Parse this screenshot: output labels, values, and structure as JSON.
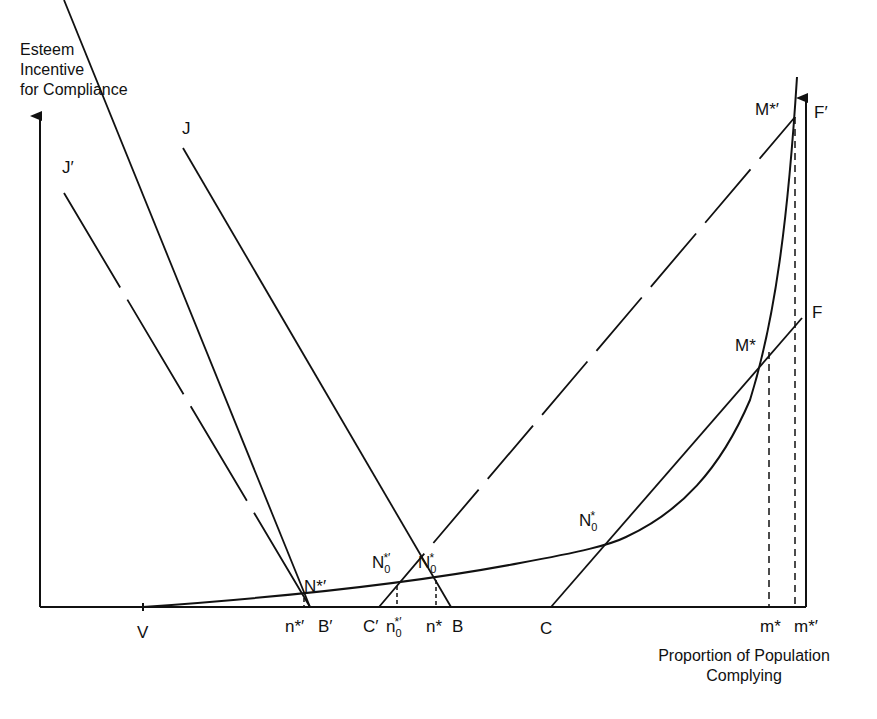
{
  "figure": {
    "y_axis_label": [
      "Esteem",
      "Incentive",
      "for Compliance"
    ],
    "x_axis_label": [
      "Proportion of Population",
      "Complying"
    ]
  },
  "curve_labels": {
    "J": "J",
    "J_prime": "J′",
    "F": "F",
    "F_prime": "F′"
  },
  "point_labels": {
    "M_star": "M*",
    "M_star_prime": "M*′",
    "N0_star": {
      "base": "N",
      "sup": "*",
      "sub": "0"
    },
    "N0_star_prime": {
      "base": "N",
      "sup": "*′",
      "sub": "0"
    },
    "N_star_prime": "N*′"
  },
  "axis_tick_labels": {
    "V": "V",
    "n_star_prime": "n*′",
    "B_prime": "B′",
    "C_prime": "C′",
    "n0_star_prime": {
      "base": "n",
      "sup": "*′",
      "sub": "0"
    },
    "n_star": "n*",
    "B": "B",
    "C": "C",
    "m_star": "m*",
    "m_star_prime": "m*′"
  },
  "colors": {
    "ink": "#111111",
    "background": "#ffffff"
  }
}
